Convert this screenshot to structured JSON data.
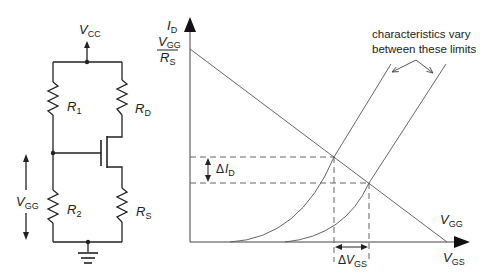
{
  "circuit": {
    "supply": {
      "main": "V",
      "sub": "CC"
    },
    "r1": {
      "main": "R",
      "sub": "1"
    },
    "rd": {
      "main": "R",
      "sub": "D"
    },
    "r2": {
      "main": "R",
      "sub": "2"
    },
    "rs": {
      "main": "R",
      "sub": "S"
    },
    "vgg": {
      "main": "V",
      "sub": "GG"
    }
  },
  "graph": {
    "y_axis": {
      "main": "I",
      "sub": "D"
    },
    "x_axis": {
      "main": "V",
      "sub": "GS"
    },
    "intercept_y": {
      "num_main": "V",
      "num_sub": "GG",
      "den_main": "R",
      "den_sub": "S"
    },
    "intercept_x": {
      "main": "V",
      "sub": "GG"
    },
    "delta_id": {
      "prefix": "Δ",
      "main": "I",
      "sub": "D"
    },
    "delta_vgs": {
      "prefix": "Δ",
      "main": "V",
      "sub": "GS"
    },
    "annotation_line1": "characteristics vary",
    "annotation_line2": "between these limits"
  },
  "colors": {
    "line": "#333333",
    "text": "#222222",
    "background": "#ffffff"
  }
}
